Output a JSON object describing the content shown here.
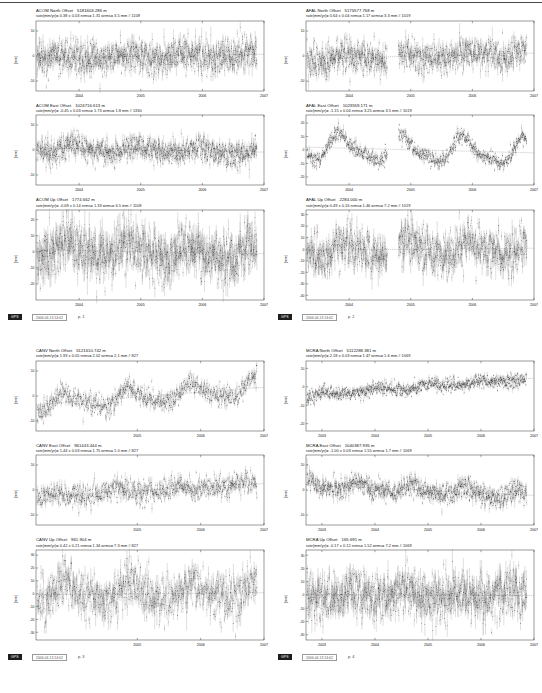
{
  "document": {
    "kind": "gps-timeseries-report",
    "columns": 2,
    "blocks": 2
  },
  "axis": {
    "ylabel": "(mm)",
    "xticks_4": [
      "2004",
      "2005",
      "2006",
      "2007"
    ],
    "xticks_5": [
      "2003",
      "2004",
      "2005",
      "2006",
      "2007"
    ],
    "yticks_10": [
      "10",
      "0",
      "-10"
    ],
    "yticks_20": [
      "20",
      "10",
      "0",
      "-10",
      "-20"
    ],
    "yticks_up": [
      "30",
      "20",
      "10",
      "0",
      "-10",
      "-20",
      "-30",
      "-40"
    ],
    "yticks_mcra_n": [
      "10",
      "0",
      "-10",
      "-20"
    ]
  },
  "footers": [
    {
      "badge": "GPS",
      "stamp": "2006-04-13 14:02",
      "page": "p. 1"
    },
    {
      "badge": "GPS",
      "stamp": "2006-04-13 14:02",
      "page": "p. 2"
    },
    {
      "badge": "GPS",
      "stamp": "2006-04-13 14:02",
      "page": "p. 3"
    },
    {
      "badge": "GPS",
      "stamp": "2006-04-13 14:02",
      "page": "p. 4"
    }
  ],
  "chart_data": [
    {
      "id": "acom-north",
      "type": "scatter",
      "title": "ACOM North Offset",
      "offset": "5181603.286 m",
      "stats": "rate(mm/yr)=  0.38 ± 0.03  nrms= 1.31  wrms= 3.5 mm # 1109",
      "station": "ACOM",
      "component": "North",
      "xlabel": "",
      "ylabel": "(mm)",
      "xlim": [
        2003.3,
        2007.0
      ],
      "ylim": [
        -14,
        14
      ],
      "yticks": [
        10,
        0,
        -10
      ],
      "xticks": [
        2004,
        2005,
        2006,
        2007
      ],
      "rate_mm_yr": 0.38,
      "rate_sigma": 0.03,
      "nrms": 1.31,
      "wrms_mm": 3.5,
      "n_points": 1109,
      "scatter_sigma": 3.2,
      "seasonal_amp": 0.9,
      "gaps": [],
      "seed": 11
    },
    {
      "id": "acom-east",
      "type": "scatter",
      "title": "ACOM East Offset",
      "offset": "1024716.613 m",
      "stats": "rate(mm/yr)= -0.45 ± 0.03  nrms= 1.73  wrms=  1.8 mm # 1330",
      "station": "ACOM",
      "component": "East",
      "xlabel": "",
      "ylabel": "(mm)",
      "xlim": [
        2003.3,
        2007.0
      ],
      "ylim": [
        -14,
        14
      ],
      "yticks": [
        10,
        0,
        -10
      ],
      "xticks": [
        2004,
        2005,
        2006,
        2007
      ],
      "rate_mm_yr": -0.45,
      "rate_sigma": 0.03,
      "nrms": 1.73,
      "wrms_mm": 1.8,
      "n_points": 1330,
      "scatter_sigma": 2.4,
      "seasonal_amp": 1.4,
      "gaps": [],
      "seed": 23
    },
    {
      "id": "acom-up",
      "type": "scatter",
      "title": "ACOM Up Offset",
      "offset": "1774.662 m",
      "stats": "rate(mm/yr)= -0.69 ± 0.14  nrms= 1.33  wrms=  6.5 mm # 1108",
      "station": "ACOM",
      "component": "Up",
      "xlabel": "",
      "ylabel": "(mm)",
      "xlim": [
        2003.3,
        2007.0
      ],
      "ylim": [
        -30,
        26
      ],
      "yticks": [
        20,
        10,
        0,
        -10,
        -20
      ],
      "xticks": [
        2004,
        2005,
        2006,
        2007
      ],
      "rate_mm_yr": -0.69,
      "rate_sigma": 0.14,
      "nrms": 1.33,
      "wrms_mm": 6.5,
      "n_points": 1108,
      "scatter_sigma": 8.0,
      "seasonal_amp": 4.5,
      "gaps": [],
      "seed": 37
    },
    {
      "id": "afal-north",
      "type": "scatter",
      "title": "AFAL North Offset",
      "offset": "5175577.768 m",
      "stats": "rate(mm/yr)=  0.64 ± 0.04  nrms= 1.17  wrms=  3.3 mm # 1019",
      "station": "AFAL",
      "component": "North",
      "xlabel": "",
      "ylabel": "(mm)",
      "xlim": [
        2003.3,
        2007.0
      ],
      "ylim": [
        -14,
        14
      ],
      "yticks": [
        10,
        0,
        -10
      ],
      "xticks": [
        2004,
        2005,
        2006,
        2007
      ],
      "rate_mm_yr": 0.64,
      "rate_sigma": 0.04,
      "nrms": 1.17,
      "wrms_mm": 3.3,
      "n_points": 1019,
      "scatter_sigma": 3.0,
      "seasonal_amp": 1.2,
      "gaps": [
        [
          2004.62,
          2004.8
        ]
      ],
      "seed": 53
    },
    {
      "id": "afal-east",
      "type": "scatter",
      "title": "AFAL East Offset",
      "offset": "1023559.171 m",
      "stats": "rate(mm/yr)= -1.15 ± 0.04  nrms= 3.25  wrms=  3.5 mm # 1019",
      "station": "AFAL",
      "component": "East",
      "xlabel": "",
      "ylabel": "(mm)",
      "xlim": [
        2003.3,
        2007.0
      ],
      "ylim": [
        -26,
        26
      ],
      "yticks": [
        20,
        10,
        0,
        -10,
        -20
      ],
      "xticks": [
        2004,
        2005,
        2006,
        2007
      ],
      "rate_mm_yr": -1.15,
      "rate_sigma": 0.04,
      "nrms": 3.25,
      "wrms_mm": 3.5,
      "n_points": 1019,
      "scatter_sigma": 2.6,
      "seasonal_amp": 9.0,
      "gaps": [
        [
          2004.62,
          2004.8
        ]
      ],
      "seed": 67
    },
    {
      "id": "afal-up",
      "type": "scatter",
      "title": "AFAL Up Offset",
      "offset": "2284.000 m",
      "stats": "rate(mm/yr)=  0.49 ± 0.16  nrms= 1.46  wrms=  7.2 mm # 1019",
      "station": "AFAL",
      "component": "Up",
      "xlabel": "",
      "ylabel": "(mm)",
      "xlim": [
        2003.3,
        2007.0
      ],
      "ylim": [
        -44,
        34
      ],
      "yticks": [
        30,
        20,
        10,
        0,
        -10,
        -20,
        -30,
        -40
      ],
      "xticks": [
        2004,
        2005,
        2006,
        2007
      ],
      "rate_mm_yr": 0.49,
      "rate_sigma": 0.16,
      "nrms": 1.46,
      "wrms_mm": 7.2,
      "n_points": 1019,
      "scatter_sigma": 9.0,
      "seasonal_amp": 6.0,
      "gaps": [
        [
          2004.62,
          2004.8
        ]
      ],
      "seed": 71
    },
    {
      "id": "canv-north",
      "type": "scatter",
      "title": "CANV North Offset",
      "offset": "5121610.742 m",
      "stats": "rate(mm/yr)=  1.93 ± 0.05  nrms= 2.02  wrms=  2.1 mm # 827",
      "station": "CANV",
      "component": "North",
      "xlabel": "",
      "ylabel": "(mm)",
      "xlim": [
        2003.4,
        2007.0
      ],
      "ylim": [
        -14,
        14
      ],
      "yticks": [
        10,
        0,
        -10
      ],
      "xticks": [
        2005,
        2006,
        2007
      ],
      "rate_mm_yr": 1.93,
      "rate_sigma": 0.05,
      "nrms": 2.02,
      "wrms_mm": 2.1,
      "n_points": 827,
      "scatter_sigma": 2.0,
      "seasonal_amp": 3.0,
      "trend_visible": true,
      "gaps": [],
      "seed": 89
    },
    {
      "id": "canv-east",
      "type": "scatter",
      "title": "CANV East Offset",
      "offset": "961443.444 m",
      "stats": "rate(mm/yr)=  1.44 ± 0.03  nrms= 1.75  wrms=  1.0 mm # 827",
      "station": "CANV",
      "component": "East",
      "xlabel": "",
      "ylabel": "(mm)",
      "xlim": [
        2003.4,
        2007.0
      ],
      "ylim": [
        -14,
        14
      ],
      "yticks": [
        10,
        0,
        -10
      ],
      "xticks": [
        2005,
        2006,
        2007
      ],
      "rate_mm_yr": 1.44,
      "rate_sigma": 0.03,
      "nrms": 1.75,
      "wrms_mm": 1.0,
      "n_points": 827,
      "scatter_sigma": 2.2,
      "seasonal_amp": 1.0,
      "gaps": [],
      "seed": 97
    },
    {
      "id": "canv-up",
      "type": "scatter",
      "title": "CANV Up Offset",
      "offset": "961.904 m",
      "stats": "rate(mm/yr)=  0.42 ± 0.21  nrms= 1.34  wrms=  7.3 mm # 827",
      "station": "CANV",
      "component": "Up",
      "xlabel": "",
      "ylabel": "(mm)",
      "xlim": [
        2003.4,
        2007.0
      ],
      "ylim": [
        -36,
        34
      ],
      "yticks": [
        30,
        20,
        10,
        0,
        -10,
        -20,
        -30
      ],
      "xticks": [
        2005,
        2006,
        2007
      ],
      "rate_mm_yr": 0.42,
      "rate_sigma": 0.21,
      "nrms": 1.34,
      "wrms_mm": 7.3,
      "n_points": 827,
      "scatter_sigma": 8.5,
      "seasonal_amp": 6.5,
      "gaps": [],
      "seed": 101
    },
    {
      "id": "mcra-north",
      "type": "scatter",
      "title": "MCRA North Offset",
      "offset": "5112288.381 m",
      "stats": "rate(mm/yr)=  2.18 ± 0.03  nrms= 1.47  wrms=  1.6 mm # 1069",
      "station": "MCRA",
      "component": "North",
      "xlabel": "",
      "ylabel": "(mm)",
      "xlim": [
        2002.7,
        2007.0
      ],
      "ylim": [
        -24,
        14
      ],
      "yticks": [
        10,
        0,
        -10,
        -20
      ],
      "xticks": [
        2003,
        2004,
        2005,
        2006,
        2007
      ],
      "rate_mm_yr": 2.18,
      "rate_sigma": 0.03,
      "nrms": 1.47,
      "wrms_mm": 1.6,
      "n_points": 1069,
      "scatter_sigma": 1.8,
      "seasonal_amp": 1.0,
      "trend_visible": true,
      "gaps": [],
      "seed": 113
    },
    {
      "id": "mcra-east",
      "type": "scatter",
      "title": "MCRA East Offset",
      "offset": "1040387.935 m",
      "stats": "rate(mm/yr)= -1.00 ± 0.03  nrms= 1.55  wrms=  1.7 mm # 1069",
      "station": "MCRA",
      "component": "East",
      "xlabel": "",
      "ylabel": "(mm)",
      "xlim": [
        2002.7,
        2007.0
      ],
      "ylim": [
        -14,
        14
      ],
      "yticks": [
        10,
        0,
        -10
      ],
      "xticks": [
        2003,
        2004,
        2005,
        2006,
        2007
      ],
      "rate_mm_yr": -1.0,
      "rate_sigma": 0.03,
      "nrms": 1.55,
      "wrms_mm": 1.7,
      "n_points": 1069,
      "scatter_sigma": 2.0,
      "seasonal_amp": 1.6,
      "gaps": [],
      "seed": 127
    },
    {
      "id": "mcra-up",
      "type": "scatter",
      "title": "MCRA Up Offset",
      "offset": "165.691 m",
      "stats": "rate(mm/yr)= -0.17 ± 0.12  nrms= 1.52  wrms=  7.2 mm # 1069",
      "station": "MCRA",
      "component": "Up",
      "xlabel": "",
      "ylabel": "(mm)",
      "xlim": [
        2002.7,
        2007.0
      ],
      "ylim": [
        -34,
        34
      ],
      "yticks": [
        30,
        20,
        10,
        0,
        -10,
        -20,
        -30
      ],
      "xticks": [
        2003,
        2004,
        2005,
        2006,
        2007
      ],
      "rate_mm_yr": -0.17,
      "rate_sigma": 0.12,
      "nrms": 1.52,
      "wrms_mm": 7.2,
      "n_points": 1069,
      "scatter_sigma": 8.5,
      "seasonal_amp": 3.0,
      "gaps": [],
      "seed": 131
    }
  ]
}
